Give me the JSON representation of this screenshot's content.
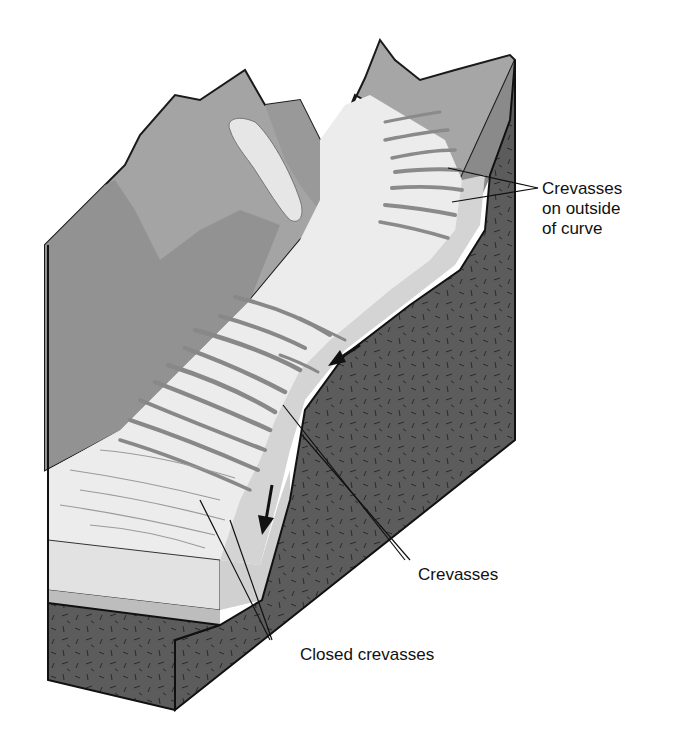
{
  "figure": {
    "labels": {
      "outside_curve_line1": "Crevasses",
      "outside_curve_line2": "on outside",
      "outside_curve_line3": "of curve",
      "crevasses": "Crevasses",
      "closed_crevasses": "Closed crevasses"
    },
    "flow_arrows": 2,
    "colors": {
      "ice": "#ebebeb",
      "ice_side": "#d6d6d6",
      "crevasse": "#8a8a8a",
      "mountain_light": "#a8a8a8",
      "mountain_dark": "#8c8c8c",
      "bedrock": "#5a5a5a",
      "outline": "#1a1a1a"
    }
  }
}
